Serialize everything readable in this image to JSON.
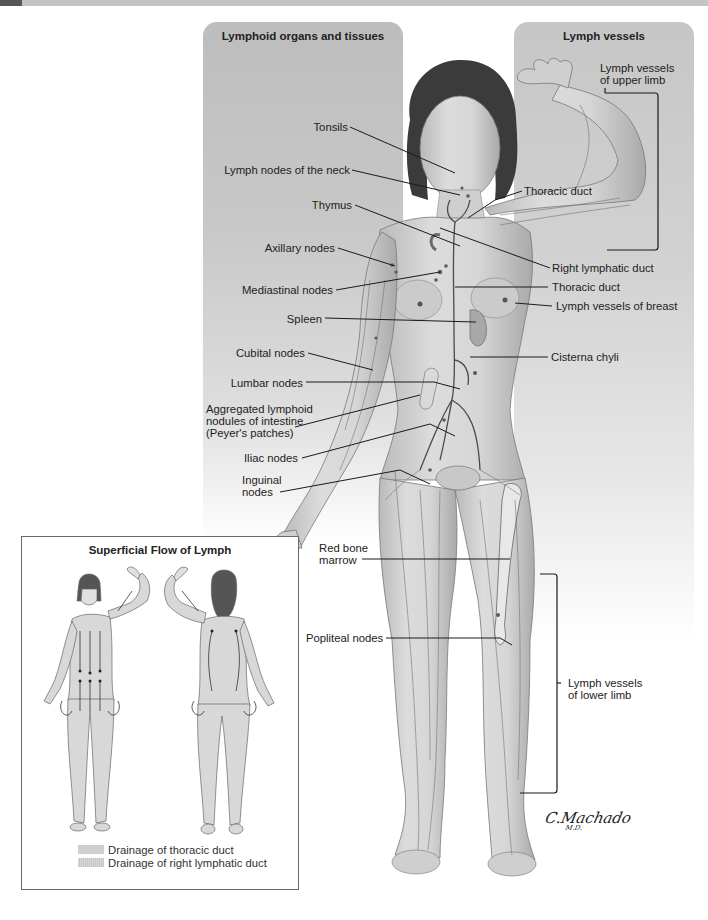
{
  "panels": {
    "left_title": "Lymphoid organs and tissues",
    "right_title": "Lymph vessels"
  },
  "labels_left": [
    {
      "id": "tonsils",
      "text": "Tonsils"
    },
    {
      "id": "neck",
      "text": "Lymph nodes of the neck"
    },
    {
      "id": "thymus",
      "text": "Thymus"
    },
    {
      "id": "axillary",
      "text": "Axillary nodes"
    },
    {
      "id": "mediastinal",
      "text": "Mediastinal nodes"
    },
    {
      "id": "spleen",
      "text": "Spleen"
    },
    {
      "id": "cubital",
      "text": "Cubital nodes"
    },
    {
      "id": "lumbar",
      "text": "Lumbar nodes"
    },
    {
      "id": "peyers",
      "text": "Aggregated lymphoid nodules of intestine (Peyer's patches)"
    },
    {
      "id": "iliac",
      "text": "Iliac nodes"
    },
    {
      "id": "inguinal",
      "text": "Inguinal nodes"
    },
    {
      "id": "marrow",
      "text": "Red bone marrow"
    },
    {
      "id": "popliteal",
      "text": "Popliteal nodes"
    }
  ],
  "labels_right": [
    {
      "id": "upper_limb",
      "text": "Lymph vessels of upper limb"
    },
    {
      "id": "thoracic_duct_1",
      "text": "Thoracic duct"
    },
    {
      "id": "right_lymphatic",
      "text": "Right lymphatic duct"
    },
    {
      "id": "thoracic_duct_2",
      "text": "Thoracic duct"
    },
    {
      "id": "breast",
      "text": "Lymph vessels of breast"
    },
    {
      "id": "cisterna",
      "text": "Cisterna chyli"
    },
    {
      "id": "lower_limb",
      "text": "Lymph vessels of lower limb"
    }
  ],
  "text": {
    "tonsils": "Tonsils",
    "neck": "Lymph nodes of the neck",
    "thymus": "Thymus",
    "axillary": "Axillary nodes",
    "mediastinal": "Mediastinal nodes",
    "spleen": "Spleen",
    "cubital": "Cubital nodes",
    "lumbar": "Lumbar nodes",
    "peyers_1": "Aggregated lymphoid",
    "peyers_2": "nodules of intestine",
    "peyers_3": "(Peyer's patches)",
    "iliac": "Iliac nodes",
    "inguinal_1": "Inguinal",
    "inguinal_2": "nodes",
    "marrow_1": "Red bone",
    "marrow_2": "marrow",
    "popliteal": "Popliteal nodes",
    "upper_limb_1": "Lymph vessels",
    "upper_limb_2": "of upper limb",
    "thoracic_duct_1": "Thoracic duct",
    "right_lymphatic": "Right lymphatic duct",
    "thoracic_duct_2": "Thoracic duct",
    "breast": "Lymph vessels of breast",
    "cisterna": "Cisterna chyli",
    "lower_limb_1": "Lymph vessels",
    "lower_limb_2": "of lower limb"
  },
  "inset": {
    "title": "Superficial Flow of Lymph",
    "views": [
      "anterior",
      "posterior"
    ],
    "legend": [
      {
        "label": "Drainage of thoracic duct",
        "swatch": "#cfcfcf"
      },
      {
        "label": "Drainage of right lymphatic duct",
        "swatch": "#d0d0d0 (hatched)"
      }
    ]
  },
  "signature": {
    "name": "C.Machado",
    "suffix": "M.D."
  },
  "colors": {
    "panel_left": "#bdbdbd",
    "panel_right": "#c6c6c6",
    "skin": "#d4d4d4",
    "vessel": "#555555",
    "leader_line": "#1a1a1a",
    "text": "#222222"
  }
}
